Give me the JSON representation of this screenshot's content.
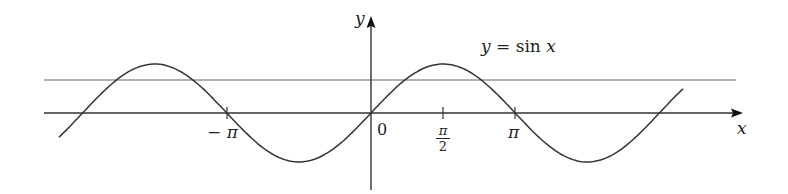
{
  "chart_data": {
    "type": "line",
    "title": "",
    "annotation": "y = sin x",
    "xlabel": "x",
    "ylabel": "y",
    "x_ticks": [
      {
        "value": -3.14159,
        "label": "−π"
      },
      {
        "value": 0,
        "label": "0"
      },
      {
        "value": 1.5708,
        "label": "π/2"
      },
      {
        "value": 3.14159,
        "label": "π"
      }
    ],
    "xlim": [
      -7.2,
      7.1
    ],
    "ylim": [
      -1.6,
      1.1
    ],
    "grid": false,
    "series": [
      {
        "name": "y = sin x",
        "function": "sin(x)",
        "x_range": [
          -6.8,
          6.8
        ],
        "color": "#333333"
      },
      {
        "name": "horizontal line",
        "function": "constant",
        "value": 0.67,
        "x_range": [
          -7.0,
          6.8
        ],
        "color": "#555555"
      }
    ],
    "pixel_mapping": {
      "origin_x": 371,
      "origin_y": 113,
      "px_per_unit_x": 45.9,
      "px_per_unit_y": 49
    }
  },
  "labels": {
    "y_axis": "y",
    "x_axis": "x",
    "curve": "y = sin x",
    "tick_neg_pi": "− π",
    "tick_zero": "0",
    "tick_half_pi_num": "π",
    "tick_half_pi_den": "2",
    "tick_pi": "π"
  }
}
